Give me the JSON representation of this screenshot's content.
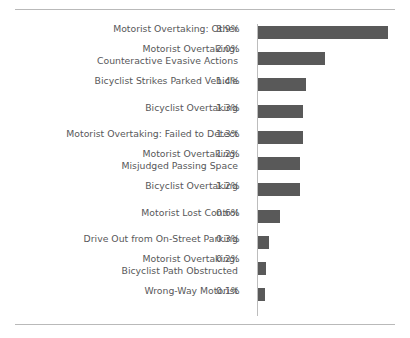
{
  "chart_data": {
    "type": "bar",
    "orientation": "horizontal",
    "title": "",
    "subtitle": "",
    "xlabel": "",
    "ylabel": "",
    "grid": false,
    "legend": null,
    "axis_baseline_at_zero": true,
    "value_suffix": "%",
    "xlim": [
      0,
      3.9
    ],
    "bar_color": "#595959",
    "text_color": "#58585a",
    "rule_color": "#b9b9b9",
    "background": "#ffffff",
    "categories": [
      "Motorist Overtaking: Other",
      "Motorist Overtaking:\nCounteractive Evasive Actions",
      "Bicyclist Strikes Parked Vehicle",
      "Bicyclist Overtaking",
      "Motorist Overtaking: Failed to Detect",
      "Motorist Overtaking:\nMisjudged Passing Space",
      "Bicyclist Overtaking",
      "Motorist Lost Control",
      "Drive Out from On-Street Parking",
      "Motorist Overtaking:\nBicyclist Path Obstructed",
      "Wrong-Way Motorist"
    ],
    "values": [
      3.9,
      2.0,
      1.4,
      1.3,
      1.3,
      1.2,
      1.2,
      0.6,
      0.3,
      0.2,
      0.1
    ],
    "value_labels": [
      "3.9%",
      "2.0%",
      "1.4%",
      "1.3%",
      "1.3%",
      "1.2%",
      "1.2%",
      "0.6%",
      "0.3%",
      "0.2%",
      "0.1%"
    ]
  },
  "rows": [
    {
      "label": "Motorist Overtaking: Other",
      "value_label": "3.9%",
      "value": 3.9,
      "bar_px": 130,
      "top": 4,
      "label_top": 1
    },
    {
      "label": "Motorist Overtaking:\nCounteractive Evasive Actions",
      "value_label": "2.0%",
      "value": 2.0,
      "bar_px": 67,
      "top": 30,
      "label_top": 21
    },
    {
      "label": "Bicyclist Strikes Parked Vehicle",
      "value_label": "1.4%",
      "value": 1.4,
      "bar_px": 48,
      "top": 56,
      "label_top": 53
    },
    {
      "label": "Bicyclist Overtaking",
      "value_label": "1.3%",
      "value": 1.3,
      "bar_px": 45,
      "top": 83,
      "label_top": 80
    },
    {
      "label": "Motorist Overtaking: Failed to Detect",
      "value_label": "1.3%",
      "value": 1.3,
      "bar_px": 45,
      "top": 109,
      "label_top": 106
    },
    {
      "label": "Motorist Overtaking:\nMisjudged Passing Space",
      "value_label": "1.2%",
      "value": 1.2,
      "bar_px": 42,
      "top": 135,
      "label_top": 126
    },
    {
      "label": "Bicyclist Overtaking",
      "value_label": "1.2%",
      "value": 1.2,
      "bar_px": 42,
      "top": 161,
      "label_top": 158
    },
    {
      "label": "Motorist Lost Control",
      "value_label": "0.6%",
      "value": 0.6,
      "bar_px": 22,
      "top": 188,
      "label_top": 185
    },
    {
      "label": "Drive Out from On-Street Parking",
      "value_label": "0.3%",
      "value": 0.3,
      "bar_px": 11,
      "top": 214,
      "label_top": 211
    },
    {
      "label": "Motorist Overtaking:\nBicyclist Path Obstructed",
      "value_label": "0.2%",
      "value": 0.2,
      "bar_px": 8,
      "top": 240,
      "label_top": 231
    },
    {
      "label": "Wrong-Way Motorist",
      "value_label": "0.1%",
      "value": 0.1,
      "bar_px": 7,
      "top": 266,
      "label_top": 263
    }
  ]
}
